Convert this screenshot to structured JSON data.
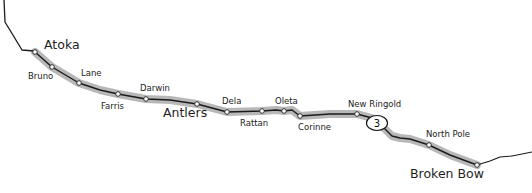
{
  "map": {
    "route_shield": "3",
    "colors": {
      "background": "#ffffff",
      "route_highlight": "#b4b4b4",
      "route_line": "#1a1a1a",
      "node_fill": "#ffffff"
    },
    "towns_major": [
      {
        "name": "Atoka",
        "x": 35,
        "y": 52
      },
      {
        "name": "Antlers",
        "x": 197,
        "y": 104
      },
      {
        "name": "Broken Bow",
        "x": 477,
        "y": 165
      }
    ],
    "stations": [
      {
        "name": "Atoka",
        "x": 35,
        "y": 52
      },
      {
        "name": "Bruno",
        "x": 52,
        "y": 67
      },
      {
        "name": "Lane",
        "x": 79,
        "y": 83
      },
      {
        "name": "Farris",
        "x": 118,
        "y": 94
      },
      {
        "name": "Darwin",
        "x": 146,
        "y": 99
      },
      {
        "name": "Antlers",
        "x": 197,
        "y": 104
      },
      {
        "name": "Dela",
        "x": 227,
        "y": 112
      },
      {
        "name": "Rattan",
        "x": 262,
        "y": 111
      },
      {
        "name": "Oleta",
        "x": 284,
        "y": 111
      },
      {
        "name": "Corinne",
        "x": 300,
        "y": 116
      },
      {
        "name": "New Ringold",
        "x": 357,
        "y": 114
      },
      {
        "name": "North Pole",
        "x": 429,
        "y": 145
      },
      {
        "name": "Broken Bow",
        "x": 477,
        "y": 165
      }
    ],
    "labels": {
      "atoka": "Atoka",
      "bruno": "Bruno",
      "lane": "Lane",
      "farris": "Farris",
      "darwin": "Darwin",
      "antlers": "Antlers",
      "dela": "Dela",
      "rattan": "Rattan",
      "oleta": "Oleta",
      "corinne": "Corinne",
      "new_ringold": "New Ringold",
      "north_pole": "North Pole",
      "broken_bow": "Broken Bow"
    }
  }
}
